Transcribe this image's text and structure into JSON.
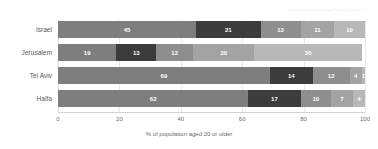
{
  "attribution": "Jerusalem Institute for Policy Research",
  "chart_data": {
    "type": "bar",
    "orientation": "horizontal",
    "stacked": true,
    "stack_mode": "percent",
    "title": "",
    "subtitle": "",
    "xlabel": "% of population aged 20 or older",
    "ylabel": "",
    "xlim": [
      0,
      100
    ],
    "xticks": [
      0,
      20,
      40,
      60,
      80,
      100
    ],
    "xtick_labels": [
      "0",
      "20",
      "40",
      "60",
      "80",
      "100"
    ],
    "grid": true,
    "grid_axis": "x",
    "legend": false,
    "legend_position": "none",
    "categories": [
      "Israel",
      "Jerusalem",
      "Tel Aviv",
      "Haifa"
    ],
    "series": [
      {
        "name": "segment-1",
        "color": "#7e7e7e",
        "values": [
          45,
          19,
          69,
          62
        ]
      },
      {
        "name": "segment-2",
        "color": "#3c3c3c",
        "values": [
          21,
          13,
          14,
          17
        ]
      },
      {
        "name": "segment-3",
        "color": "#8e8e8e",
        "values": [
          13,
          12,
          12,
          10
        ]
      },
      {
        "name": "segment-4",
        "color": "#a3a3a3",
        "values": [
          11,
          20,
          4,
          7
        ]
      },
      {
        "name": "segment-5",
        "color": "#b8b8b8",
        "values": [
          10,
          35,
          1,
          4
        ]
      }
    ],
    "rows": [
      {
        "category": "Israel",
        "values": [
          45,
          21,
          13,
          11,
          10
        ],
        "labels": [
          "45",
          "21",
          "13",
          "11",
          "10"
        ]
      },
      {
        "category": "Jerusalem",
        "values": [
          19,
          13,
          12,
          20,
          35
        ],
        "labels": [
          "19",
          "13",
          "12",
          "20",
          "35"
        ]
      },
      {
        "category": "Tel Aviv",
        "values": [
          69,
          14,
          12,
          4,
          1
        ],
        "labels": [
          "69",
          "14",
          "12",
          "4",
          "1"
        ]
      },
      {
        "category": "Haifa",
        "values": [
          62,
          17,
          10,
          7,
          4
        ],
        "labels": [
          "62",
          "17",
          "10",
          "7",
          "4"
        ]
      }
    ],
    "colors": [
      "#7e7e7e",
      "#3c3c3c",
      "#8e8e8e",
      "#a3a3a3",
      "#b8b8b8"
    ],
    "background_color": "#ffffff",
    "grid_color": "#e9e9e9",
    "label_color": "#ffffff",
    "tick_color": "#6a6a6a"
  }
}
